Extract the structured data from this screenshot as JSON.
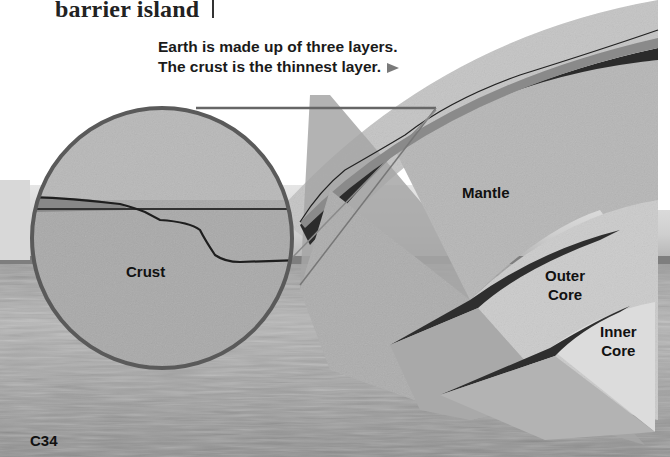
{
  "page": {
    "glossary_term": "barrier island",
    "page_number": "C34"
  },
  "figure": {
    "caption": "Earth is made up of three layers. The crust is the thinnest layer.",
    "caption_arrow_icon": "right-triangle-icon",
    "magnifier_label": "Crust",
    "layers": [
      {
        "name": "Crust"
      },
      {
        "name": "Mantle"
      },
      {
        "name": "Outer Core",
        "line1": "Outer",
        "line2": "Core"
      },
      {
        "name": "Inner Core",
        "line1": "Inner",
        "line2": "Core"
      }
    ]
  },
  "colors": {
    "background": "#ffffff",
    "sky": "#b9b9b9",
    "field": "#a8a8a8",
    "mantle": "#b4b4b4",
    "outer_core": "#c9c9c9",
    "inner_core": "#dedede",
    "crust_band": "#2a2a2a",
    "magnifier_ring": "#555555",
    "text": "#111111"
  }
}
